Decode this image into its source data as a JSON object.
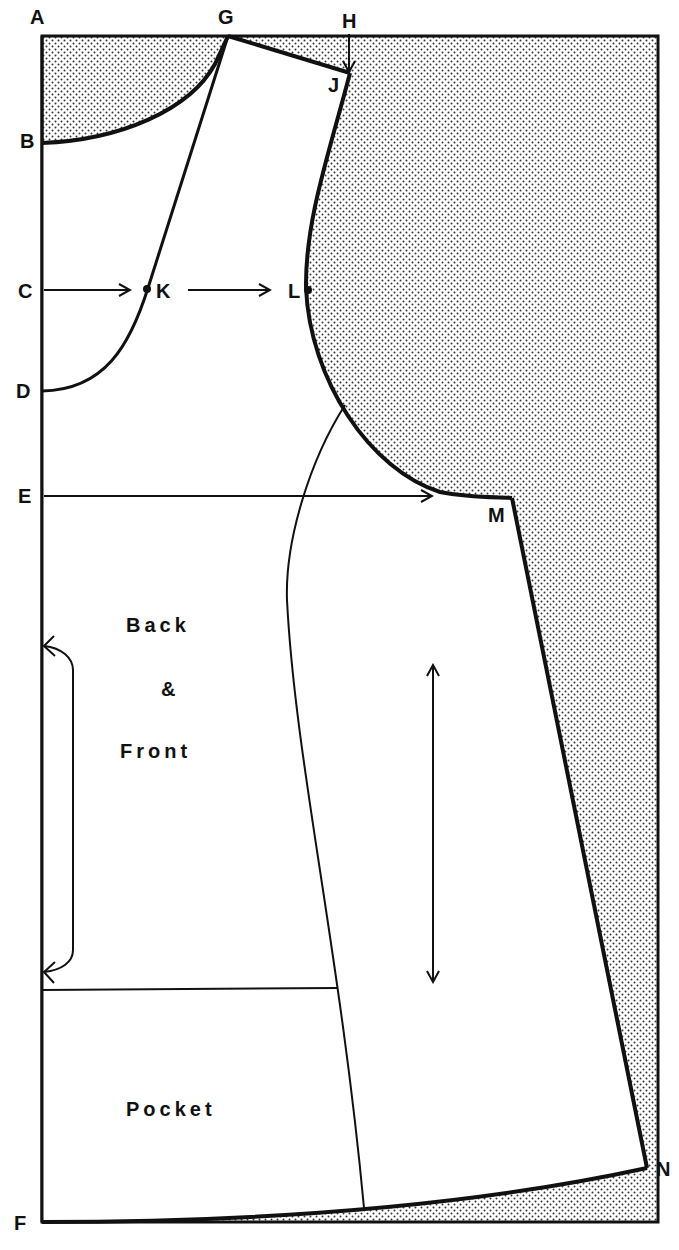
{
  "diagram": {
    "type": "sewing-pattern",
    "colors": {
      "line": "#111111",
      "background": "#ffffff",
      "shading_dots": "#333333"
    },
    "points": {
      "A": "A",
      "B": "B",
      "C": "C",
      "D": "D",
      "E": "E",
      "F": "F",
      "G": "G",
      "H": "H",
      "J": "J",
      "K": "K",
      "L": "L",
      "M": "M",
      "N": "N"
    },
    "pieces": {
      "back_front": [
        "Back",
        "&",
        "Front"
      ],
      "pocket": "Pocket"
    },
    "markers": {
      "grainline": "double-arrow",
      "place_on_fold": "bracket-arrow",
      "c_to_k": "arrow",
      "k_to_l": "arrow",
      "e_to_m": "arrow",
      "h_to_j": "arrow"
    }
  }
}
